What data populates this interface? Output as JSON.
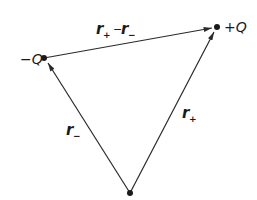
{
  "diagram": {
    "type": "vector-triangle",
    "colors": {
      "line": "#2a2a2a",
      "background": "#ffffff"
    },
    "points": {
      "minus_q": {
        "label": "-Q",
        "x": 44,
        "y": 58
      },
      "plus_q": {
        "label": "+Q",
        "x": 217,
        "y": 27
      },
      "origin": {
        "label": "",
        "x": 130,
        "y": 193
      }
    },
    "vectors": [
      {
        "id": "r_minus",
        "from": "origin",
        "to": "minus_q",
        "label": "r",
        "subscript": "−"
      },
      {
        "id": "r_plus",
        "from": "origin",
        "to": "plus_q",
        "label": "r",
        "subscript": "+"
      },
      {
        "id": "r_diff",
        "from": "minus_q",
        "to": "plus_q",
        "label": "r₊ − r₋"
      }
    ],
    "labels": {
      "minus_q": "−Q",
      "plus_q": "+Q",
      "r_diff_r1": "r",
      "r_diff_sub1": "+",
      "r_diff_op": "−",
      "r_diff_r2": "r",
      "r_diff_sub2": "−",
      "r_minus": "r",
      "r_minus_sub": "−",
      "r_plus": "r",
      "r_plus_sub": "+"
    }
  }
}
